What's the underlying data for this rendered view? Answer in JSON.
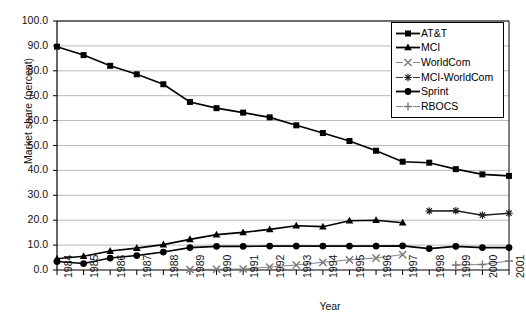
{
  "chart_data": {
    "type": "line",
    "title": "",
    "xlabel": "Year",
    "ylabel": "Market share (percent)",
    "xlim": [
      1984,
      2001
    ],
    "ylim": [
      0.0,
      100.0
    ],
    "ytick_step": 10.0,
    "grid": "horizontal",
    "legend_position": "top-right",
    "x": [
      1984,
      1985,
      1986,
      1987,
      1988,
      1989,
      1990,
      1991,
      1992,
      1993,
      1994,
      1995,
      1996,
      1997,
      1998,
      1999,
      2000,
      2001
    ],
    "xticklabels": [
      "1984",
      "1985",
      "1986",
      "1987",
      "1988",
      "1989",
      "1990",
      "1991",
      "1992",
      "1993",
      "1994",
      "1995",
      "1996",
      "1997",
      "1998",
      "1999",
      "2000",
      "2001"
    ],
    "yticklabels": [
      "0.0",
      "10.0",
      "20.0",
      "30.0",
      "40.0",
      "50.0",
      "60.0",
      "70.0",
      "80.0",
      "90.0",
      "100.0"
    ],
    "series": [
      {
        "name": "AT&T",
        "marker": "square",
        "color": "#000000",
        "values": [
          89.7,
          86.3,
          82.0,
          78.6,
          74.6,
          67.5,
          65.0,
          63.2,
          61.3,
          58.1,
          55.0,
          51.8,
          47.9,
          43.5,
          43.1,
          40.5,
          38.4,
          37.8
        ]
      },
      {
        "name": "MCI",
        "marker": "triangle",
        "color": "#000000",
        "values": [
          4.5,
          5.5,
          7.6,
          8.8,
          10.2,
          12.3,
          14.2,
          15.1,
          16.3,
          17.8,
          17.4,
          19.8,
          20.0,
          19.0,
          null,
          null,
          null,
          null
        ]
      },
      {
        "name": "WorldCom",
        "marker": "x",
        "color": "#777777",
        "values": [
          null,
          null,
          null,
          null,
          null,
          0.2,
          0.3,
          0.4,
          1.2,
          2.0,
          3.1,
          4.1,
          4.8,
          6.2,
          null,
          null,
          null,
          null
        ]
      },
      {
        "name": "MCI-WorldCom",
        "marker": "asterisk",
        "color": "#222222",
        "values": [
          null,
          null,
          null,
          null,
          null,
          null,
          null,
          null,
          null,
          null,
          null,
          null,
          null,
          null,
          23.7,
          23.8,
          22.0,
          22.8
        ]
      },
      {
        "name": "Sprint",
        "marker": "circle",
        "color": "#000000",
        "values": [
          3.4,
          2.6,
          4.8,
          5.8,
          7.2,
          9.0,
          9.5,
          9.5,
          9.6,
          9.6,
          9.6,
          9.6,
          9.6,
          9.7,
          8.6,
          9.5,
          9.0,
          9.0
        ]
      },
      {
        "name": "RBOCS",
        "marker": "plus",
        "color": "#777777",
        "values": [
          null,
          null,
          null,
          null,
          null,
          null,
          null,
          null,
          null,
          null,
          null,
          null,
          null,
          null,
          null,
          2.0,
          2.2,
          3.6
        ]
      }
    ]
  }
}
